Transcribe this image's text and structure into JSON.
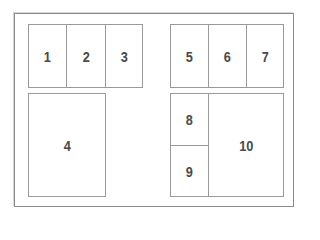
{
  "diagram": {
    "type": "page layout panel grid",
    "panels": [
      {
        "id": "1",
        "label": "1"
      },
      {
        "id": "2",
        "label": "2"
      },
      {
        "id": "3",
        "label": "3"
      },
      {
        "id": "4",
        "label": "4"
      },
      {
        "id": "5",
        "label": "5"
      },
      {
        "id": "6",
        "label": "6"
      },
      {
        "id": "7",
        "label": "7"
      },
      {
        "id": "8",
        "label": "8"
      },
      {
        "id": "9",
        "label": "9"
      },
      {
        "id": "10",
        "label": "10"
      }
    ],
    "colors": {
      "border": "#9a9a9a",
      "text": "#4a4a4a",
      "background": "#ffffff"
    }
  }
}
